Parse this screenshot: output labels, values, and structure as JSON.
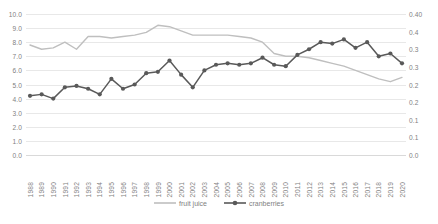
{
  "chart_data": {
    "type": "line",
    "title": "",
    "subtitle": "",
    "xlabel": "",
    "ylabel": "",
    "grid": true,
    "legend_position": "bottom",
    "categories": [
      "1988",
      "1989",
      "1990",
      "1991",
      "1992",
      "1993",
      "1994",
      "1995",
      "1996",
      "1997",
      "1998",
      "1999",
      "2000",
      "2001",
      "2002",
      "2003",
      "2004",
      "2005",
      "2006",
      "2007",
      "2008",
      "2009",
      "2010",
      "2011",
      "2012",
      "2013",
      "2014",
      "2015",
      "2016",
      "2017",
      "2018",
      "2019",
      "2020"
    ],
    "axes": {
      "left": {
        "ticks": [
          "0.0",
          "1.0",
          "2.0",
          "3.0",
          "4.0",
          "5.0",
          "6.0",
          "7.0",
          "8.0",
          "9.0",
          "10.0"
        ],
        "values": [
          0,
          1,
          2,
          3,
          4,
          5,
          6,
          7,
          8,
          9,
          10
        ],
        "min": 0,
        "max": 10
      },
      "right": {
        "ticks": [
          "0.0",
          "0.1",
          "0.1",
          "0.2",
          "0.2",
          "0.3",
          "0.3",
          "0.4"
        ],
        "full_ticks": [
          "0.00",
          "0.05",
          "0.10",
          "0.15",
          "0.20",
          "0.25",
          "0.30",
          "0.35",
          "0.40"
        ],
        "values": [
          0.0,
          0.05,
          0.1,
          0.15,
          0.2,
          0.25,
          0.3,
          0.35,
          0.4
        ],
        "min": 0,
        "max": 0.4,
        "note": "labels clipped at right edge of image"
      }
    },
    "series": [
      {
        "name": "fruit juice",
        "axis": "left",
        "color": "#bfbfbf",
        "markers": false,
        "values": [
          7.8,
          7.5,
          7.6,
          8.0,
          7.5,
          8.4,
          8.4,
          8.3,
          8.4,
          8.5,
          8.7,
          9.2,
          9.1,
          8.8,
          8.5,
          8.5,
          8.5,
          8.5,
          8.4,
          8.3,
          8.0,
          7.2,
          7.0,
          7.0,
          6.9,
          6.7,
          6.5,
          6.3,
          6.0,
          5.7,
          5.4,
          5.2,
          5.5
        ]
      },
      {
        "name": "cranberries",
        "axis": "left",
        "color": "#595959",
        "markers": true,
        "values": [
          4.2,
          4.3,
          4.0,
          4.8,
          4.9,
          4.7,
          4.3,
          5.4,
          4.7,
          5.0,
          5.8,
          5.9,
          6.7,
          5.7,
          4.8,
          6.0,
          6.4,
          6.5,
          6.4,
          6.5,
          6.9,
          6.4,
          6.3,
          7.1,
          7.5,
          8.0,
          7.9,
          8.2,
          7.6,
          8.0,
          7.0,
          7.2,
          6.5
        ]
      }
    ]
  },
  "legend": {
    "entries": [
      {
        "label": "fruit juice"
      },
      {
        "label": "cranberries"
      }
    ]
  },
  "colors": {
    "fruit_juice": "#bfbfbf",
    "cranberries": "#595959",
    "gridline": "#e8e8e8",
    "axis_text": "#7f7f7f",
    "background": "#ffffff"
  }
}
